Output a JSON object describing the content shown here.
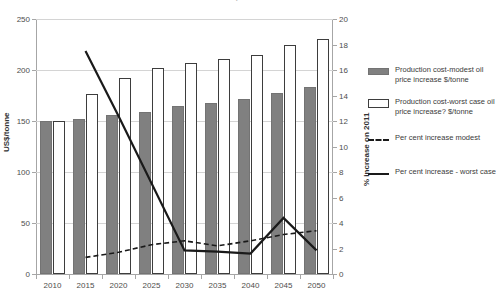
{
  "chart": {
    "title": "Impact of ...",
    "left_axis": {
      "label": "US$/tonne",
      "ticks": [
        "0",
        "50",
        "100",
        "150",
        "200",
        "250"
      ],
      "min": 0,
      "max": 250
    },
    "right_axis": {
      "label": "% increase on 2011",
      "ticks": [
        "0",
        "2",
        "4",
        "6",
        "8",
        "10",
        "12",
        "14",
        "16",
        "18",
        "20"
      ],
      "min": 0,
      "max": 20
    },
    "x_axis": {
      "label": "",
      "ticks": [
        "2010",
        "2015",
        "2020",
        "2025",
        "2030",
        "2035",
        "2040",
        "2045",
        "2050"
      ]
    },
    "legend": [
      {
        "key": "swatch-grey",
        "label": "Production cost-modest oil price increase $/tonne"
      },
      {
        "key": "swatch-white",
        "label": "Production cost-worst case oil price increase? $/tonne"
      },
      {
        "key": "swatch-dash",
        "label": "Per cent increase modest"
      },
      {
        "key": "swatch-solid",
        "label": "Per cent increase - worst case"
      }
    ],
    "colors": {
      "bar_modest": "#808080",
      "bar_worst_fill": "#ffffff",
      "bar_worst_stroke": "#3d3d3d",
      "line": "#1a1a1a",
      "grid": "#d4d4d4",
      "axis": "#a6a6a6"
    }
  },
  "chart_data": {
    "type": "bar",
    "title": "Impact of ...",
    "xlabel": "",
    "ylabel": "US$/tonne",
    "y2label": "% increase on 2011",
    "ylim": [
      0,
      250
    ],
    "y2lim": [
      0,
      20
    ],
    "grid": true,
    "legend_position": "right",
    "categories": [
      "2010",
      "2015",
      "2020",
      "2025",
      "2030",
      "2035",
      "2040",
      "2045",
      "2050"
    ],
    "series": [
      {
        "name": "Production cost-modest oil price increase $/tonne",
        "type": "bar",
        "axis": "left",
        "values": [
          150,
          152,
          156,
          159,
          165,
          168,
          172,
          177,
          183
        ]
      },
      {
        "name": "Production cost-worst case oil price increase? $/tonne",
        "type": "bar",
        "axis": "left",
        "values": [
          150,
          176,
          192,
          202,
          207,
          211,
          215,
          225,
          230
        ]
      },
      {
        "name": "Per cent increase modest",
        "type": "line",
        "style": "dashed",
        "axis": "right",
        "values": [
          null,
          1.3,
          1.7,
          2.3,
          2.6,
          2.2,
          2.6,
          3.1,
          3.4
        ]
      },
      {
        "name": "Per cent increase - worst case",
        "type": "line",
        "style": "solid",
        "axis": "right",
        "values": [
          null,
          17.5,
          12.4,
          null,
          1.85,
          1.75,
          1.6,
          4.4,
          1.85
        ]
      }
    ]
  }
}
